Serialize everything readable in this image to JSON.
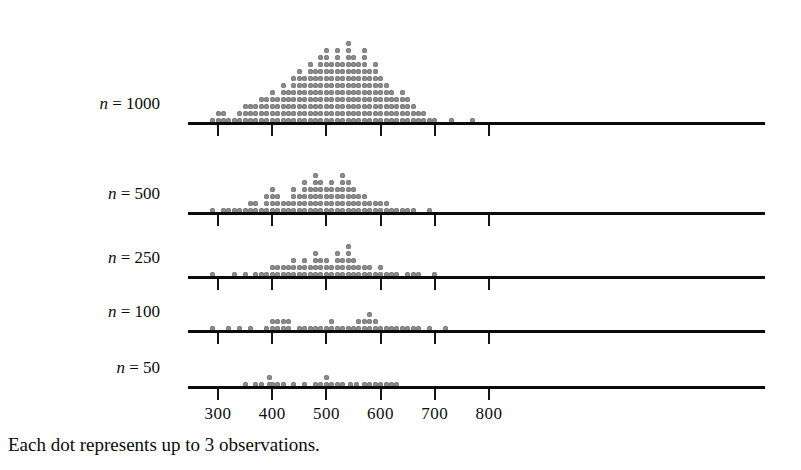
{
  "figure": {
    "caption": "Each dot represents up to 3 observations.",
    "dot_color": "#8e8e8e",
    "axis_color": "#0b0b0b"
  },
  "axis": {
    "ticks": [
      300,
      400,
      500,
      600,
      700,
      800
    ],
    "tick_labels": [
      "300",
      "400",
      "500",
      "600",
      "700",
      "800"
    ],
    "x_min_value": 245,
    "x_max_value": 845,
    "pixel_at_300": 218,
    "pixel_per_unit": 0.542
  },
  "rows": [
    {
      "label": "n = 1000",
      "label_n": "n",
      "label_eq": "=",
      "label_value": "1000",
      "baseline_y": 122
    },
    {
      "label": "n = 500",
      "label_n": "n",
      "label_eq": "=",
      "label_value": "500",
      "baseline_y": 212
    },
    {
      "label": "n = 250",
      "label_n": "n",
      "label_eq": "=",
      "label_value": "250",
      "baseline_y": 276
    },
    {
      "label": "n = 100",
      "label_n": "n",
      "label_eq": "=",
      "label_value": "100",
      "baseline_y": 330
    },
    {
      "label": "n = 50",
      "label_n": "n",
      "label_eq": "=",
      "label_value": "50",
      "baseline_y": 386
    }
  ],
  "chart_data": {
    "type": "dotplot",
    "title": "",
    "xlabel": "",
    "ylabel": "",
    "note": "Each dot represents up to 3 observations.",
    "xlim": [
      245,
      845
    ],
    "xticks": [
      300,
      400,
      500,
      600,
      700,
      800
    ],
    "grid": false,
    "legend": "none",
    "bin_width": 10,
    "dots_per_observation": 3,
    "series": [
      {
        "name": "n = 1000",
        "bins": [
          290,
          300,
          310,
          320,
          330,
          340,
          350,
          360,
          370,
          380,
          390,
          400,
          410,
          420,
          430,
          440,
          450,
          460,
          470,
          480,
          490,
          500,
          510,
          520,
          530,
          540,
          550,
          560,
          570,
          580,
          590,
          600,
          610,
          620,
          630,
          640,
          650,
          660,
          670,
          680,
          690,
          700,
          730,
          770
        ],
        "counts": [
          1,
          2,
          2,
          1,
          1,
          2,
          3,
          3,
          3,
          4,
          4,
          5,
          4,
          6,
          5,
          7,
          8,
          7,
          9,
          8,
          10,
          11,
          9,
          11,
          9,
          12,
          10,
          9,
          11,
          8,
          9,
          7,
          6,
          5,
          4,
          5,
          4,
          3,
          2,
          2,
          1,
          1,
          1,
          1
        ]
      },
      {
        "name": "n = 500",
        "bins": [
          290,
          310,
          320,
          330,
          340,
          350,
          360,
          370,
          380,
          390,
          400,
          410,
          420,
          430,
          440,
          450,
          460,
          470,
          480,
          490,
          500,
          510,
          520,
          530,
          540,
          550,
          560,
          570,
          580,
          590,
          600,
          610,
          620,
          630,
          640,
          650,
          660,
          690
        ],
        "counts": [
          1,
          1,
          1,
          1,
          1,
          1,
          2,
          2,
          1,
          3,
          4,
          3,
          2,
          2,
          4,
          3,
          5,
          4,
          6,
          5,
          4,
          5,
          4,
          6,
          5,
          4,
          3,
          3,
          2,
          2,
          2,
          2,
          1,
          1,
          1,
          1,
          1,
          1
        ]
      },
      {
        "name": "n = 250",
        "bins": [
          290,
          330,
          350,
          370,
          380,
          390,
          400,
          410,
          420,
          430,
          440,
          450,
          460,
          470,
          480,
          490,
          500,
          510,
          520,
          530,
          540,
          550,
          560,
          570,
          580,
          590,
          600,
          610,
          620,
          630,
          650,
          660,
          670,
          700
        ],
        "counts": [
          1,
          1,
          1,
          1,
          1,
          1,
          2,
          2,
          2,
          2,
          3,
          2,
          3,
          2,
          4,
          3,
          3,
          2,
          4,
          3,
          5,
          3,
          2,
          2,
          2,
          1,
          2,
          1,
          1,
          1,
          1,
          1,
          1,
          1
        ]
      },
      {
        "name": "n = 100",
        "bins": [
          290,
          320,
          340,
          360,
          390,
          400,
          410,
          420,
          430,
          450,
          460,
          470,
          480,
          490,
          500,
          510,
          520,
          530,
          540,
          550,
          560,
          570,
          580,
          590,
          600,
          610,
          620,
          630,
          640,
          650,
          660,
          670,
          690,
          720
        ],
        "counts": [
          1,
          1,
          1,
          1,
          1,
          2,
          2,
          2,
          2,
          1,
          1,
          1,
          1,
          1,
          1,
          2,
          1,
          1,
          1,
          1,
          2,
          2,
          3,
          2,
          1,
          1,
          1,
          1,
          1,
          1,
          1,
          1,
          1,
          1
        ]
      },
      {
        "name": "n = 50",
        "bins": [
          350,
          370,
          380,
          395,
          400,
          410,
          420,
          440,
          460,
          480,
          490,
          500,
          510,
          520,
          530,
          545,
          555,
          570,
          580,
          590,
          600,
          610,
          620,
          630
        ],
        "counts": [
          1,
          1,
          1,
          2,
          1,
          1,
          1,
          1,
          1,
          1,
          1,
          2,
          1,
          1,
          1,
          1,
          1,
          1,
          1,
          1,
          1,
          1,
          1,
          1
        ]
      }
    ]
  }
}
